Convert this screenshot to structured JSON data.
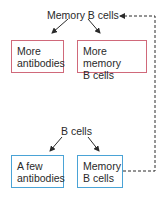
{
  "colors": {
    "memory_box_border": "#d0697a",
    "initial_box_border": "#4aa3d6",
    "text": "#2a2a2a",
    "arrow": "#2a2a2a"
  },
  "secondary": {
    "source_label": "Memory B cells",
    "outputs": [
      {
        "line1": "More",
        "line2": "antibodies"
      },
      {
        "line1": "More memory",
        "line2": "B cells"
      }
    ]
  },
  "primary": {
    "source_label": "B cells",
    "outputs": [
      {
        "line1": "A few",
        "line2": "antibodies"
      },
      {
        "line1": "Memory",
        "line2": "B cells"
      }
    ]
  },
  "feedback_connector": {
    "from": "Memory B cells (primary)",
    "to": "Memory B cells (secondary)",
    "style": "dashed"
  }
}
